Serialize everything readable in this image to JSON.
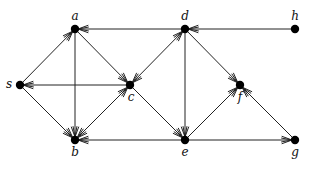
{
  "diagram": {
    "type": "directed-graph",
    "nodes": [
      {
        "id": "a",
        "label": "a",
        "x": 75,
        "y": 29,
        "lx": 75,
        "ly": 20
      },
      {
        "id": "d",
        "label": "d",
        "x": 185,
        "y": 29,
        "lx": 185,
        "ly": 20
      },
      {
        "id": "h",
        "label": "h",
        "x": 295,
        "y": 29,
        "lx": 295,
        "ly": 20
      },
      {
        "id": "s",
        "label": "s",
        "x": 20,
        "y": 85,
        "lx": 9,
        "ly": 88
      },
      {
        "id": "c",
        "label": "c",
        "x": 130,
        "y": 85,
        "lx": 131,
        "ly": 101
      },
      {
        "id": "f",
        "label": "f",
        "x": 240,
        "y": 85,
        "lx": 240,
        "ly": 101
      },
      {
        "id": "b",
        "label": "b",
        "x": 75,
        "y": 140,
        "lx": 75,
        "ly": 156
      },
      {
        "id": "e",
        "label": "e",
        "x": 185,
        "y": 140,
        "lx": 185,
        "ly": 156
      },
      {
        "id": "g",
        "label": "g",
        "x": 295,
        "y": 140,
        "lx": 295,
        "ly": 156
      }
    ],
    "edges": [
      {
        "from": "d",
        "to": "a"
      },
      {
        "from": "h",
        "to": "d"
      },
      {
        "from": "s",
        "to": "a"
      },
      {
        "from": "a",
        "to": "c"
      },
      {
        "from": "a",
        "to": "b"
      },
      {
        "from": "c",
        "to": "s"
      },
      {
        "from": "s",
        "to": "b"
      },
      {
        "from": "c",
        "to": "b"
      },
      {
        "from": "b",
        "to": "c"
      },
      {
        "from": "c",
        "to": "d"
      },
      {
        "from": "d",
        "to": "c"
      },
      {
        "from": "d",
        "to": "e"
      },
      {
        "from": "d",
        "to": "f"
      },
      {
        "from": "c",
        "to": "e"
      },
      {
        "from": "e",
        "to": "b"
      },
      {
        "from": "e",
        "to": "f"
      },
      {
        "from": "g",
        "to": "f"
      },
      {
        "from": "e",
        "to": "g"
      }
    ]
  }
}
